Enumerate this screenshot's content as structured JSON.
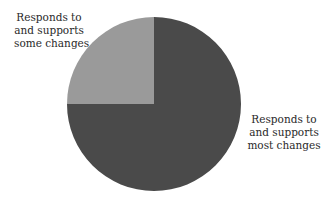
{
  "chart_data": {
    "type": "pie",
    "title": "",
    "slices": [
      {
        "label": "Responds to and supports most changes",
        "label_lines": [
          "Responds to",
          "and supports",
          "most changes"
        ],
        "value": 75,
        "color": "#4a4a4a"
      },
      {
        "label": "Responds to and supports some changes",
        "label_lines": [
          "Responds to",
          "and supports",
          "some changes"
        ],
        "value": 25,
        "color": "#9a9a9a"
      }
    ],
    "categories": [
      "Responds to and supports most changes",
      "Responds to and supports some changes"
    ],
    "values": [
      75,
      25
    ],
    "legend": "none (direct labels)",
    "start_angle_deg": 0,
    "direction": "clockwise"
  },
  "labels": {
    "some": [
      "Responds to",
      "and supports",
      "some changes"
    ],
    "most": [
      "Responds to",
      "and supports",
      "most changes"
    ]
  }
}
